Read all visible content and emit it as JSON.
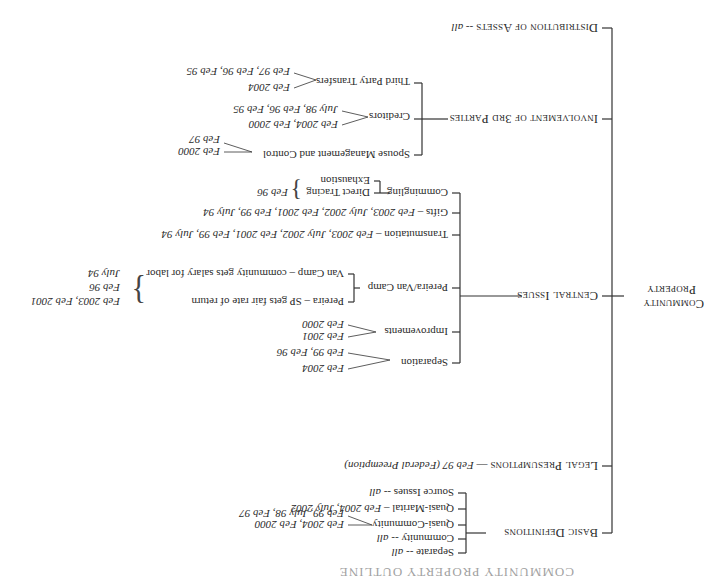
{
  "cutoff_heading": "COMMUNITY PROPERTY OUTLINE",
  "root": {
    "line1": "Community",
    "line2": "Property"
  },
  "branches": {
    "basic_definitions": {
      "label": "Basic Definitions",
      "items": [
        {
          "label": "Separate -- ",
          "dates": "all"
        },
        {
          "label": "Community -- ",
          "dates": "all"
        },
        {
          "label": "Quasi-Community",
          "dates1": "Feb 2004, Feb 2000",
          "dates2": "Feb 99, July 98, Feb 97"
        },
        {
          "label": "Quasi-Marital – ",
          "dates": "Feb 2004, July 2002"
        },
        {
          "label": "Source Issues -- ",
          "dates": "all"
        }
      ]
    },
    "legal_presumptions": {
      "label": "Legal Presumptions",
      "sep": " — ",
      "dates": "Feb 97 (Federal Preemption)"
    },
    "central_issues": {
      "label": "Central Issues",
      "items": [
        {
          "label": "Separation",
          "dates1": "Feb 2004",
          "dates2": "Feb 99, Feb 96"
        },
        {
          "label": "Improvements",
          "dates1": "Feb 2001",
          "dates2": "Feb 2000"
        },
        {
          "label": "Pereira/Van Camp",
          "sub": [
            {
              "label": "Pereira – SP gets fair rate of return"
            },
            {
              "label": "Van Camp – community gets salary for labor"
            }
          ],
          "dates": [
            "Feb 2003, Feb 2001",
            "Feb 96",
            "July 94"
          ]
        },
        {
          "label": "Transmutation – ",
          "dates": "Feb 2003, July 2002, Feb 2001, Feb 99, July 94"
        },
        {
          "label": "Gifts – ",
          "dates": "Feb 2003, July 2002, Feb 2001, Feb 99, July 94"
        },
        {
          "label": "Commingling",
          "sub": [
            {
              "label": "Direct Tracing"
            },
            {
              "label": "Exhaustion"
            }
          ],
          "dates": "Feb 96"
        }
      ]
    },
    "third_parties": {
      "label": "Involvement of 3rd Parties",
      "items": [
        {
          "label": "Spouse Management and Control",
          "dates1": "Feb 2000",
          "dates2": "Feb 97"
        },
        {
          "label": "Creditors",
          "dates1": "Feb 2004, Feb 2000",
          "dates2": "July 98, Feb 96, Feb 95"
        },
        {
          "label": "Third Party Transfers",
          "dates1": "Feb 2004",
          "dates2": "Feb 97, Feb 96, Feb 95"
        }
      ]
    },
    "distribution": {
      "label": "Distribution of Assets",
      "sep": " -- ",
      "dates": "all"
    }
  }
}
